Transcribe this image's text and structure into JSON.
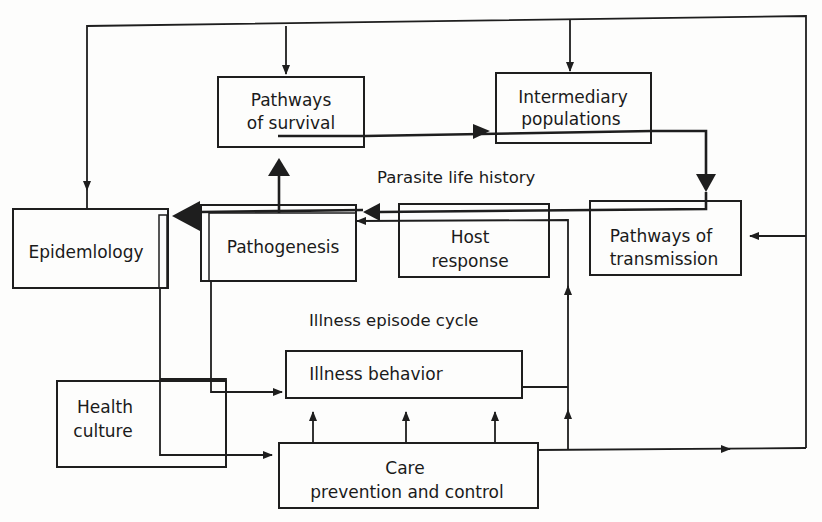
{
  "diagram": {
    "nodes": {
      "pathways_survival": [
        "Pathways",
        "of survival"
      ],
      "intermediary": [
        "Intermediary",
        "populations"
      ],
      "epidemiology": [
        "Epidemlology"
      ],
      "pathogenesis": [
        "Pathogenesis"
      ],
      "host_response": [
        "Host",
        "response"
      ],
      "pathways_transmission": [
        "Pathways of",
        "transmission"
      ],
      "illness_behavior": [
        "Illness behavior"
      ],
      "health_culture": [
        "Health",
        "culture"
      ],
      "care": [
        "Care",
        "prevention and control"
      ]
    },
    "captions": {
      "parasite_cycle": "Parasite life history",
      "illness_cycle": "Illness episode cycle"
    },
    "edges": [
      {
        "from": "pathogenesis",
        "to": "pathways_survival",
        "style": "bold"
      },
      {
        "from": "pathways_survival",
        "to": "intermediary",
        "style": "bold"
      },
      {
        "from": "intermediary",
        "to": "pathways_transmission",
        "style": "bold"
      },
      {
        "from": "pathways_transmission",
        "to": "host_response",
        "style": "bold"
      },
      {
        "from": "host_response",
        "to": "pathogenesis",
        "style": "bold"
      },
      {
        "from": "pathogenesis",
        "to": "epidemiology",
        "style": "bold"
      },
      {
        "from": "epidemiology",
        "to": "health_culture",
        "style": "thin"
      },
      {
        "from": "pathogenesis",
        "to": "illness_behavior",
        "style": "thin"
      },
      {
        "from": "health_culture",
        "to": "care",
        "style": "thin"
      },
      {
        "from": "care",
        "to": "illness_behavior",
        "style": "thin"
      },
      {
        "from": "care",
        "to": "host_response",
        "style": "thin"
      },
      {
        "from": "illness_behavior",
        "to": "host_response",
        "style": "thin"
      },
      {
        "from": "care",
        "to": "pathways_transmission",
        "style": "thin"
      },
      {
        "from": "care",
        "to": "pathways_survival",
        "style": "thin"
      },
      {
        "from": "care",
        "to": "intermediary",
        "style": "thin"
      },
      {
        "from": "care",
        "to": "epidemiology",
        "style": "thin"
      }
    ]
  }
}
